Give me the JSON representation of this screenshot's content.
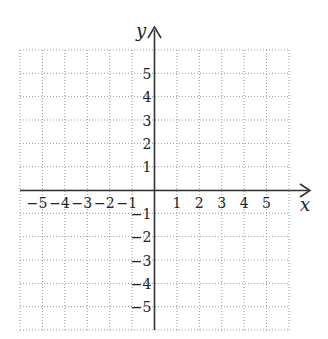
{
  "chart_data": {
    "type": "coordinate-grid",
    "title": "",
    "xlabel": "x",
    "ylabel": "y",
    "xlim": [
      -6,
      6
    ],
    "ylim": [
      -6,
      6
    ],
    "grid": true,
    "grid_style": "dotted",
    "x_tick_labels": [
      "-5",
      "-4",
      "-3",
      "-2",
      "-1",
      "1",
      "2",
      "3",
      "4",
      "5"
    ],
    "y_tick_labels": [
      "5",
      "4",
      "3",
      "2",
      "1",
      "-1",
      "-2",
      "-3",
      "-4",
      "-5"
    ],
    "x_ticks": [
      -5,
      -4,
      -3,
      -2,
      -1,
      1,
      2,
      3,
      4,
      5
    ],
    "y_ticks": [
      5,
      4,
      3,
      2,
      1,
      -1,
      -2,
      -3,
      -4,
      -5
    ],
    "series": []
  },
  "axes": {
    "x_label": "x",
    "y_label": "y"
  },
  "colors": {
    "axis": "#333333",
    "grid": "#999999",
    "text": "#222222"
  }
}
